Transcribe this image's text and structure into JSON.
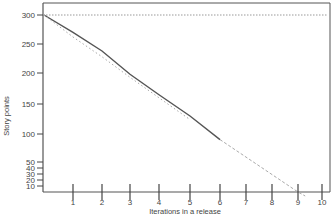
{
  "chart_data": {
    "type": "line",
    "title": "",
    "xlabel": "Iterations in a release",
    "ylabel": "Story points",
    "x_ticks": [
      1,
      2,
      3,
      4,
      5,
      6,
      7,
      8,
      9,
      10
    ],
    "y_ticks": [
      10,
      20,
      30,
      40,
      50,
      100,
      150,
      200,
      250,
      300
    ],
    "xlim": [
      0,
      10.3
    ],
    "ylim": [
      0,
      310
    ],
    "grid": false,
    "legend": "none",
    "series": [
      {
        "name": "Actual burndown",
        "style": "solid",
        "color": "#555555",
        "x": [
          0,
          1,
          2,
          3,
          4,
          5,
          6
        ],
        "y": [
          300,
          270,
          238,
          198,
          165,
          130,
          90
        ]
      },
      {
        "name": "Ideal burndown",
        "style": "dotted",
        "color": "#aaaaaa",
        "x": [
          0,
          1,
          2,
          3,
          4,
          5
        ],
        "y": [
          300,
          262,
          228,
          193,
          160,
          124
        ]
      },
      {
        "name": "Projected burndown",
        "style": "dashed",
        "color": "#aaaaaa",
        "x": [
          6,
          9,
          9.3
        ],
        "y": [
          90,
          0,
          -10
        ]
      }
    ],
    "reference_lines": [
      {
        "name": "Total scope",
        "orientation": "horizontal",
        "value": 300,
        "style": "dotted",
        "color": "#999999"
      }
    ]
  }
}
